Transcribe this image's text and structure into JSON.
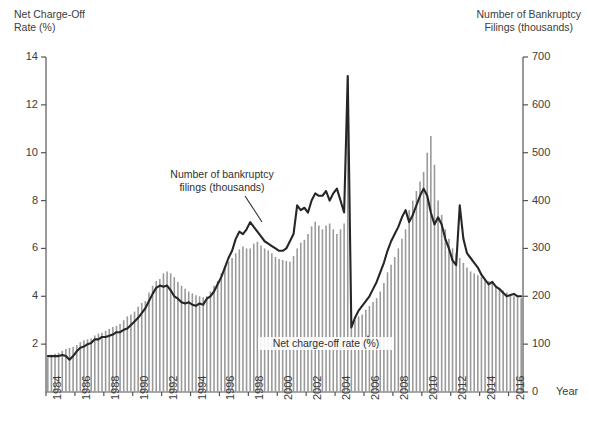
{
  "left_axis": {
    "title": "Net Charge-Off\nRate (%)",
    "ticks": [
      "14",
      "12",
      "10",
      "8",
      "6",
      "4",
      "2"
    ]
  },
  "right_axis": {
    "title": "Number of Bankruptcy\nFilings (thousands)",
    "ticks": [
      "700",
      "600",
      "500",
      "400",
      "300",
      "200",
      "100",
      "0"
    ],
    "unit_label": "Year"
  },
  "annotations": {
    "bars": "Number of bankruptcy\nfilings (thousands)",
    "line": "Net charge-off rate (%)"
  },
  "colors": {
    "line": "#262626",
    "bars": "#9a9a9a",
    "axis": "#555555",
    "text": "#3c3c3c",
    "background": "#ffffff"
  },
  "chart_data": {
    "type": "bar",
    "title": "",
    "subtitle": "",
    "xlabel": "Year",
    "ylabel": "Net Charge-Off Rate (%)",
    "y2label": "Number of Bankruptcy Filings (thousands)",
    "ylim": [
      0,
      14
    ],
    "y2lim": [
      0,
      700
    ],
    "grid": false,
    "legend": "annotations-inline",
    "xlim": [
      1984,
      2017
    ],
    "xtick_labels": [
      "1984",
      "1986",
      "1988",
      "1990",
      "1992",
      "1994",
      "1996",
      "1998",
      "2000",
      "2002",
      "2004",
      "2006",
      "2008",
      "2010",
      "2012",
      "2014",
      "2016"
    ],
    "xtick_rotation": -90,
    "frequency": "quarterly",
    "series": [
      {
        "name": "Number of bankruptcy filings (thousands)",
        "axis": "right",
        "render": "bar",
        "color": "#9a9a9a",
        "x": [
          1984.0,
          1984.25,
          1984.5,
          1984.75,
          1985.0,
          1985.25,
          1985.5,
          1985.75,
          1986.0,
          1986.25,
          1986.5,
          1986.75,
          1987.0,
          1987.25,
          1987.5,
          1987.75,
          1988.0,
          1988.25,
          1988.5,
          1988.75,
          1989.0,
          1989.25,
          1989.5,
          1989.75,
          1990.0,
          1990.25,
          1990.5,
          1990.75,
          1991.0,
          1991.25,
          1991.5,
          1991.75,
          1992.0,
          1992.25,
          1992.5,
          1992.75,
          1993.0,
          1993.25,
          1993.5,
          1993.75,
          1994.0,
          1994.25,
          1994.5,
          1994.75,
          1995.0,
          1995.25,
          1995.5,
          1995.75,
          1996.0,
          1996.25,
          1996.5,
          1996.75,
          1997.0,
          1997.25,
          1997.5,
          1997.75,
          1998.0,
          1998.25,
          1998.5,
          1998.75,
          1999.0,
          1999.25,
          1999.5,
          1999.75,
          2000.0,
          2000.25,
          2000.5,
          2000.75,
          2001.0,
          2001.25,
          2001.5,
          2001.75,
          2002.0,
          2002.25,
          2002.5,
          2002.75,
          2003.0,
          2003.25,
          2003.5,
          2003.75,
          2004.0,
          2004.25,
          2004.5,
          2004.75,
          2005.0,
          2005.25,
          2005.5,
          2005.75,
          2006.0,
          2006.25,
          2006.5,
          2006.75,
          2007.0,
          2007.25,
          2007.5,
          2007.75,
          2008.0,
          2008.25,
          2008.5,
          2008.75,
          2009.0,
          2009.25,
          2009.5,
          2009.75,
          2010.0,
          2010.25,
          2010.5,
          2010.75,
          2011.0,
          2011.25,
          2011.5,
          2011.75,
          2012.0,
          2012.25,
          2012.5,
          2012.75,
          2013.0,
          2013.25,
          2013.5,
          2013.75,
          2014.0,
          2014.25,
          2014.5,
          2014.75,
          2015.0,
          2015.25,
          2015.5,
          2015.75,
          2016.0,
          2016.25,
          2016.5,
          2016.75
        ],
        "values": [
          72,
          78,
          80,
          82,
          86,
          90,
          92,
          94,
          98,
          104,
          108,
          110,
          112,
          118,
          122,
          124,
          128,
          132,
          136,
          138,
          142,
          150,
          158,
          162,
          168,
          178,
          186,
          190,
          208,
          222,
          232,
          236,
          248,
          252,
          248,
          240,
          230,
          222,
          216,
          210,
          206,
          202,
          200,
          198,
          200,
          210,
          222,
          232,
          248,
          262,
          272,
          280,
          290,
          298,
          304,
          300,
          300,
          310,
          314,
          306,
          300,
          296,
          290,
          282,
          278,
          276,
          274,
          272,
          284,
          300,
          312,
          318,
          330,
          346,
          356,
          348,
          340,
          348,
          352,
          340,
          330,
          340,
          352,
          660,
          140,
          150,
          158,
          162,
          172,
          180,
          188,
          196,
          210,
          228,
          250,
          266,
          282,
          300,
          320,
          340,
          380,
          400,
          420,
          440,
          460,
          500,
          535,
          475,
          400,
          370,
          340,
          320,
          300,
          290,
          280,
          270,
          260,
          252,
          248,
          244,
          240,
          236,
          232,
          228,
          222,
          218,
          212,
          208,
          202,
          200,
          198,
          196
        ]
      },
      {
        "name": "Net charge-off rate (%)",
        "axis": "left",
        "render": "line",
        "color": "#262626",
        "x": [
          1984.0,
          1984.25,
          1984.5,
          1984.75,
          1985.0,
          1985.25,
          1985.5,
          1985.75,
          1986.0,
          1986.25,
          1986.5,
          1986.75,
          1987.0,
          1987.25,
          1987.5,
          1987.75,
          1988.0,
          1988.25,
          1988.5,
          1988.75,
          1989.0,
          1989.25,
          1989.5,
          1989.75,
          1990.0,
          1990.25,
          1990.5,
          1990.75,
          1991.0,
          1991.25,
          1991.5,
          1991.75,
          1992.0,
          1992.25,
          1992.5,
          1992.75,
          1993.0,
          1993.25,
          1993.5,
          1993.75,
          1994.0,
          1994.25,
          1994.5,
          1994.75,
          1995.0,
          1995.25,
          1995.5,
          1995.75,
          1996.0,
          1996.25,
          1996.5,
          1996.75,
          1997.0,
          1997.25,
          1997.5,
          1997.75,
          1998.0,
          1998.25,
          1998.5,
          1998.75,
          1999.0,
          1999.25,
          1999.5,
          1999.75,
          2000.0,
          2000.25,
          2000.5,
          2000.75,
          2001.0,
          2001.25,
          2001.5,
          2001.75,
          2002.0,
          2002.25,
          2002.5,
          2002.75,
          2003.0,
          2003.25,
          2003.5,
          2003.75,
          2004.0,
          2004.25,
          2004.5,
          2004.75,
          2005.0,
          2005.25,
          2005.5,
          2005.75,
          2006.0,
          2006.25,
          2006.5,
          2006.75,
          2007.0,
          2007.25,
          2007.5,
          2007.75,
          2008.0,
          2008.25,
          2008.5,
          2008.75,
          2009.0,
          2009.25,
          2009.5,
          2009.75,
          2010.0,
          2010.25,
          2010.5,
          2010.75,
          2011.0,
          2011.25,
          2011.5,
          2011.75,
          2012.0,
          2012.25,
          2012.5,
          2012.75,
          2013.0,
          2013.25,
          2013.5,
          2013.75,
          2014.0,
          2014.25,
          2014.5,
          2014.75,
          2015.0,
          2015.25,
          2015.5,
          2015.75,
          2016.0,
          2016.25,
          2016.5,
          2016.75
        ],
        "values": [
          1.5,
          1.5,
          1.5,
          1.5,
          1.55,
          1.5,
          1.35,
          1.5,
          1.7,
          1.85,
          1.9,
          2.0,
          2.05,
          2.2,
          2.2,
          2.3,
          2.3,
          2.35,
          2.4,
          2.5,
          2.5,
          2.6,
          2.65,
          2.8,
          2.95,
          3.1,
          3.3,
          3.5,
          3.8,
          4.1,
          4.35,
          4.45,
          4.4,
          4.45,
          4.25,
          4.0,
          3.9,
          3.75,
          3.7,
          3.75,
          3.65,
          3.6,
          3.7,
          3.65,
          3.9,
          4.0,
          4.2,
          4.5,
          4.8,
          5.2,
          5.6,
          5.9,
          6.4,
          6.7,
          6.6,
          6.8,
          7.1,
          6.9,
          6.7,
          6.5,
          6.3,
          6.2,
          6.1,
          6.0,
          5.9,
          5.9,
          6.0,
          6.3,
          6.6,
          7.8,
          7.6,
          7.7,
          7.5,
          8.0,
          8.3,
          8.2,
          8.2,
          8.4,
          8.0,
          8.3,
          8.5,
          8.0,
          7.5,
          13.2,
          2.7,
          3.1,
          3.4,
          3.6,
          3.8,
          4.0,
          4.3,
          4.6,
          5.0,
          5.4,
          5.9,
          6.3,
          6.6,
          6.9,
          7.3,
          7.6,
          7.1,
          7.4,
          7.8,
          8.2,
          8.5,
          8.2,
          7.5,
          7.0,
          7.3,
          7.0,
          6.4,
          6.0,
          5.5,
          5.3,
          7.8,
          6.4,
          5.8,
          5.6,
          5.4,
          5.2,
          4.9,
          4.7,
          4.5,
          4.6,
          4.4,
          4.3,
          4.15,
          4.0,
          4.05,
          4.1,
          4.0,
          4.0
        ]
      }
    ]
  }
}
